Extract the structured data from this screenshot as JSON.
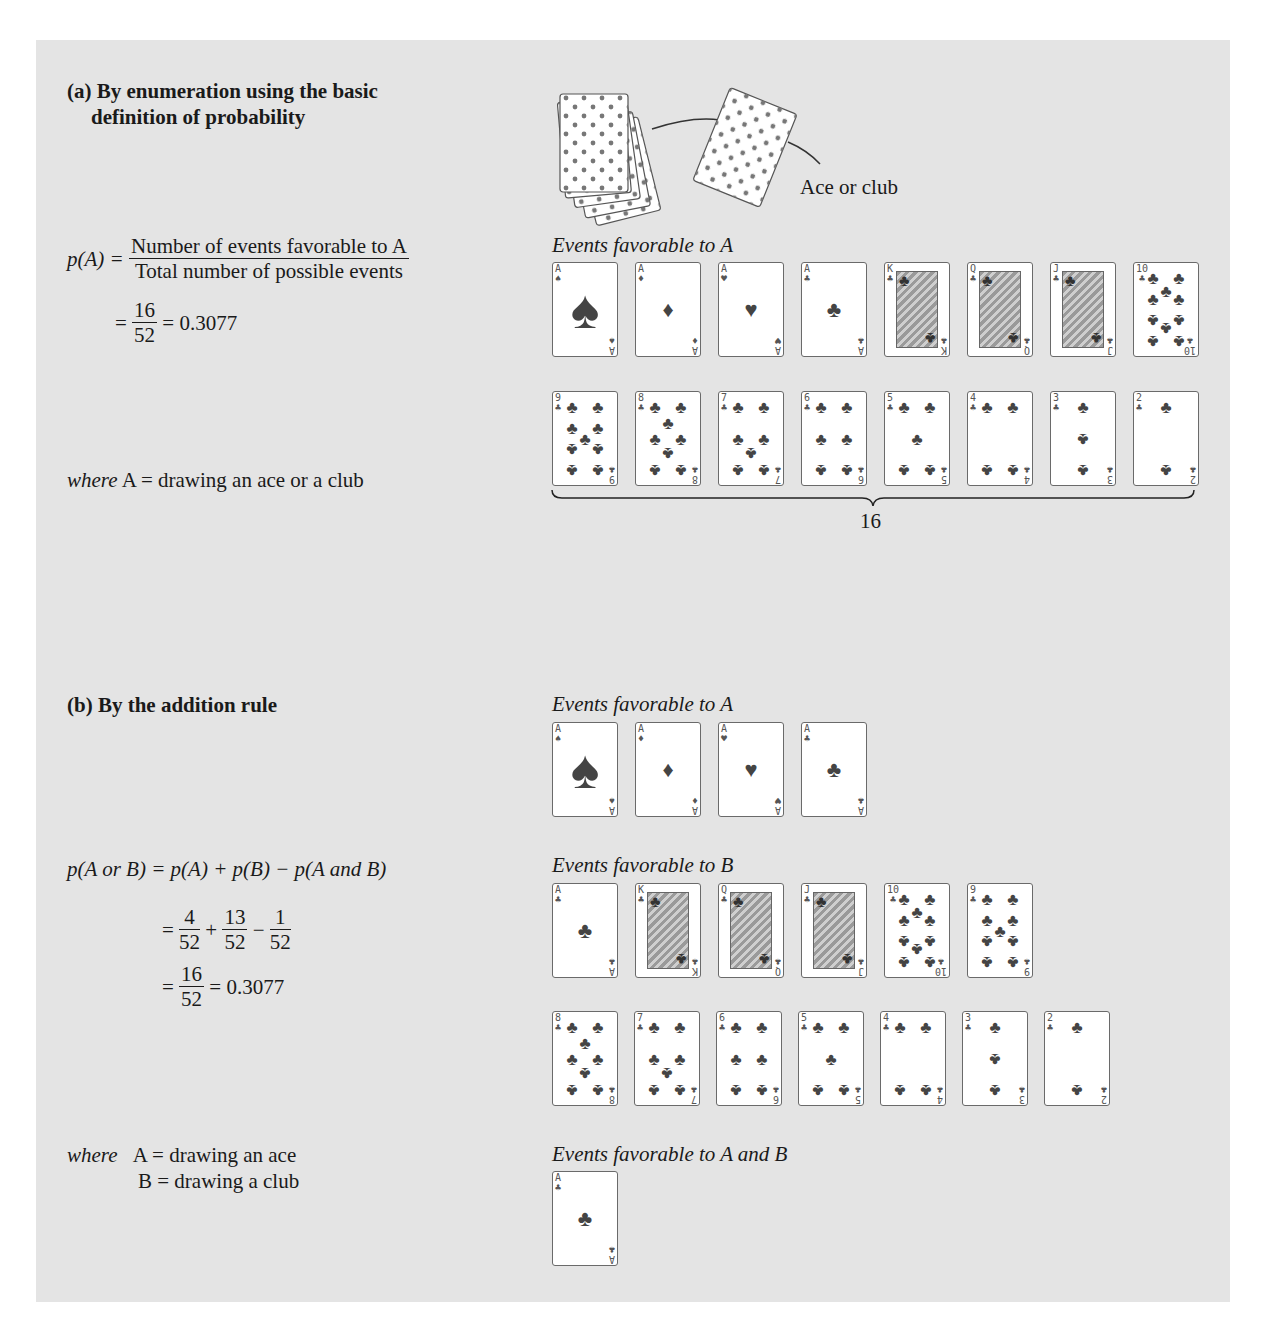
{
  "section_a": {
    "heading_line1": "(a) By enumeration using the basic",
    "heading_line2": "definition of probability",
    "formula": {
      "lhs": "p(A) =",
      "numerator": "Number of events favorable to A",
      "denominator": "Total number of possible events",
      "step_eq": "=",
      "step_num": "16",
      "step_den": "52",
      "result": "= 0.3077"
    },
    "where": {
      "prefix": "where",
      "text": "A = drawing an ace or a club"
    },
    "illustration_label": "Ace or club",
    "events_label": "Events favorable to A",
    "brace_count": "16",
    "cards_row1": [
      {
        "rank": "A",
        "suit": "♠",
        "kind": "ace"
      },
      {
        "rank": "A",
        "suit": "♦",
        "kind": "ace"
      },
      {
        "rank": "A",
        "suit": "♥",
        "kind": "ace"
      },
      {
        "rank": "A",
        "suit": "♣",
        "kind": "ace"
      },
      {
        "rank": "K",
        "suit": "♣",
        "kind": "face"
      },
      {
        "rank": "Q",
        "suit": "♣",
        "kind": "face"
      },
      {
        "rank": "J",
        "suit": "♣",
        "kind": "face"
      },
      {
        "rank": "10",
        "suit": "♣",
        "kind": "pip"
      }
    ],
    "cards_row2": [
      {
        "rank": "9",
        "suit": "♣",
        "kind": "pip"
      },
      {
        "rank": "8",
        "suit": "♣",
        "kind": "pip"
      },
      {
        "rank": "7",
        "suit": "♣",
        "kind": "pip"
      },
      {
        "rank": "6",
        "suit": "♣",
        "kind": "pip"
      },
      {
        "rank": "5",
        "suit": "♣",
        "kind": "pip"
      },
      {
        "rank": "4",
        "suit": "♣",
        "kind": "pip"
      },
      {
        "rank": "3",
        "suit": "♣",
        "kind": "pip"
      },
      {
        "rank": "2",
        "suit": "♣",
        "kind": "pip"
      }
    ]
  },
  "section_b": {
    "heading": "(b) By the addition rule",
    "formula": {
      "line1": "p(A or B) = p(A) + p(B) − p(A and B)",
      "f1_num": "4",
      "f1_den": "52",
      "plus": "+",
      "f2_num": "13",
      "f2_den": "52",
      "minus": "−",
      "f3_num": "1",
      "f3_den": "52",
      "eq": "=",
      "r_num": "16",
      "r_den": "52",
      "result": "= 0.3077"
    },
    "where": {
      "prefix": "where",
      "line1": "A = drawing an ace",
      "line2": "B = drawing a club"
    },
    "events_a_label": "Events favorable to A",
    "events_b_label": "Events favorable to B",
    "events_ab_label": "Events favorable to A and B",
    "cards_a": [
      {
        "rank": "A",
        "suit": "♠",
        "kind": "ace"
      },
      {
        "rank": "A",
        "suit": "♦",
        "kind": "ace"
      },
      {
        "rank": "A",
        "suit": "♥",
        "kind": "ace"
      },
      {
        "rank": "A",
        "suit": "♣",
        "kind": "ace"
      }
    ],
    "cards_b_row1": [
      {
        "rank": "A",
        "suit": "♣",
        "kind": "ace"
      },
      {
        "rank": "K",
        "suit": "♣",
        "kind": "face"
      },
      {
        "rank": "Q",
        "suit": "♣",
        "kind": "face"
      },
      {
        "rank": "J",
        "suit": "♣",
        "kind": "face"
      },
      {
        "rank": "10",
        "suit": "♣",
        "kind": "pip"
      },
      {
        "rank": "9",
        "suit": "♣",
        "kind": "pip"
      }
    ],
    "cards_b_row2": [
      {
        "rank": "8",
        "suit": "♣",
        "kind": "pip"
      },
      {
        "rank": "7",
        "suit": "♣",
        "kind": "pip"
      },
      {
        "rank": "6",
        "suit": "♣",
        "kind": "pip"
      },
      {
        "rank": "5",
        "suit": "♣",
        "kind": "pip"
      },
      {
        "rank": "4",
        "suit": "♣",
        "kind": "pip"
      },
      {
        "rank": "3",
        "suit": "♣",
        "kind": "pip"
      },
      {
        "rank": "2",
        "suit": "♣",
        "kind": "pip"
      }
    ],
    "cards_ab": [
      {
        "rank": "A",
        "suit": "♣",
        "kind": "ace"
      }
    ]
  },
  "colors": {
    "panel": "#e4e4e4",
    "card_border": "#6a6a6a",
    "pip": "#444444"
  }
}
